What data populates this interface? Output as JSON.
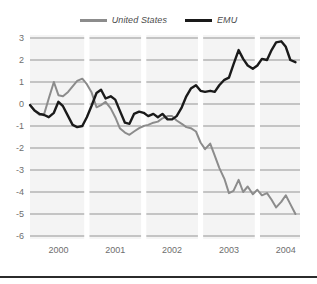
{
  "legend": {
    "position": "top-center",
    "entries": [
      {
        "label": "United States",
        "color": "#8c8c8c",
        "name": "legend-united-states"
      },
      {
        "label": "EMU",
        "color": "#1a1a1a",
        "name": "legend-emu"
      }
    ]
  },
  "colors": {
    "united_states": "#8c8c8c",
    "emu": "#1a1a1a",
    "gridline": "#b5b5b5",
    "plot_background": "#f4f4f4",
    "band_separator": "#ffffff",
    "tick_text": "#6e6e6e",
    "bottom_rule": "#2b2b2b"
  },
  "axes": {
    "y_ticks": [
      "3",
      "2",
      "1",
      "0",
      "-1",
      "-2",
      "-3",
      "-4",
      "-5",
      "-6"
    ],
    "x_ticks": [
      "2000",
      "2001",
      "2002",
      "2003",
      "2004"
    ],
    "ylim": [
      -6,
      3
    ],
    "xlim": [
      1999.5,
      2004.25
    ],
    "grid": "horizontal"
  },
  "chart_data": {
    "type": "line",
    "title": "",
    "subtitle": "",
    "xlabel": "",
    "ylabel": "",
    "xlim": [
      1999.5,
      2004.25
    ],
    "ylim": [
      -6,
      3
    ],
    "grid": true,
    "legend_position": "top-center",
    "x_tick_labels": [
      "2000",
      "2001",
      "2002",
      "2003",
      "2004"
    ],
    "x_tick_values": [
      2000,
      2001,
      2002,
      2003,
      2004
    ],
    "y_tick_values": [
      3,
      2,
      1,
      0,
      -1,
      -2,
      -3,
      -4,
      -5,
      -6
    ],
    "series": [
      {
        "name": "United States",
        "color": "#8c8c8c",
        "x": [
          1999.5,
          1999.58,
          1999.67,
          1999.75,
          1999.83,
          1999.92,
          2000.0,
          2000.08,
          2000.17,
          2000.25,
          2000.33,
          2000.42,
          2000.5,
          2000.58,
          2000.67,
          2000.75,
          2000.83,
          2000.92,
          2001.0,
          2001.08,
          2001.17,
          2001.25,
          2001.33,
          2001.42,
          2001.5,
          2001.58,
          2001.67,
          2001.75,
          2001.83,
          2001.92,
          2002.0,
          2002.08,
          2002.17,
          2002.25,
          2002.33,
          2002.42,
          2002.5,
          2002.58,
          2002.67,
          2002.75,
          2002.83,
          2002.92,
          2003.0,
          2003.08,
          2003.17,
          2003.25,
          2003.33,
          2003.42,
          2003.5,
          2003.58,
          2003.67,
          2003.75,
          2003.83,
          2003.92,
          2004.0,
          2004.08,
          2004.17
        ],
        "y": [
          -0.05,
          -0.3,
          -0.5,
          -0.45,
          0.25,
          1.0,
          0.4,
          0.35,
          0.55,
          0.8,
          1.05,
          1.15,
          0.9,
          0.55,
          -0.15,
          -0.05,
          0.1,
          -0.2,
          -0.6,
          -1.1,
          -1.3,
          -1.4,
          -1.25,
          -1.1,
          -1.0,
          -0.95,
          -0.85,
          -0.8,
          -0.65,
          -0.55,
          -0.55,
          -0.75,
          -0.9,
          -1.05,
          -1.1,
          -1.25,
          -1.75,
          -2.05,
          -1.8,
          -2.35,
          -2.9,
          -3.4,
          -4.05,
          -3.95,
          -3.45,
          -4.0,
          -3.75,
          -4.1,
          -3.9,
          -4.15,
          -4.05,
          -4.35,
          -4.7,
          -4.45,
          -4.15,
          -4.55,
          -5.0
        ]
      },
      {
        "name": "EMU",
        "color": "#1a1a1a",
        "x": [
          1999.5,
          1999.58,
          1999.67,
          1999.75,
          1999.83,
          1999.92,
          2000.0,
          2000.08,
          2000.17,
          2000.25,
          2000.33,
          2000.42,
          2000.5,
          2000.58,
          2000.67,
          2000.75,
          2000.83,
          2000.92,
          2001.0,
          2001.08,
          2001.17,
          2001.25,
          2001.33,
          2001.42,
          2001.5,
          2001.58,
          2001.67,
          2001.75,
          2001.83,
          2001.92,
          2002.0,
          2002.08,
          2002.17,
          2002.25,
          2002.33,
          2002.42,
          2002.5,
          2002.58,
          2002.67,
          2002.75,
          2002.83,
          2002.92,
          2003.0,
          2003.08,
          2003.17,
          2003.25,
          2003.33,
          2003.42,
          2003.5,
          2003.58,
          2003.67,
          2003.75,
          2003.83,
          2003.92,
          2004.0,
          2004.08,
          2004.17
        ],
        "y": [
          -0.05,
          -0.3,
          -0.45,
          -0.5,
          -0.6,
          -0.4,
          0.1,
          -0.1,
          -0.55,
          -0.95,
          -1.05,
          -1.0,
          -0.6,
          -0.1,
          0.5,
          0.65,
          0.25,
          0.35,
          0.2,
          -0.3,
          -0.85,
          -0.9,
          -0.45,
          -0.35,
          -0.4,
          -0.55,
          -0.45,
          -0.6,
          -0.45,
          -0.7,
          -0.7,
          -0.55,
          -0.15,
          0.35,
          0.7,
          0.85,
          0.6,
          0.55,
          0.6,
          0.55,
          0.85,
          1.1,
          1.2,
          1.8,
          2.45,
          2.05,
          1.75,
          1.6,
          1.75,
          2.05,
          2.0,
          2.45,
          2.8,
          2.85,
          2.6,
          2.0,
          1.9
        ]
      }
    ]
  }
}
